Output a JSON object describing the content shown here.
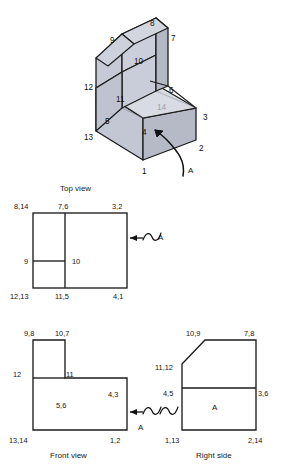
{
  "drawing": {
    "title_visible": false,
    "stroke_color": "#1c1c1c",
    "face_colors": {
      "top_light": "#d7dae2",
      "top_mid": "#cdd1db",
      "front_left": "#c2c6d2",
      "front_right": "#b9bdca",
      "slope": "#cacee0",
      "inner_base": "#d9dce4"
    }
  },
  "isometric": {
    "name": "isometric-pictorial",
    "vertex_labels": [
      {
        "id": "1",
        "text": "1",
        "x": 142,
        "y": 168
      },
      {
        "id": "2",
        "text": "2",
        "x": 199,
        "y": 145
      },
      {
        "id": "3",
        "text": "3",
        "x": 203,
        "y": 114
      },
      {
        "id": "4",
        "text": "4",
        "x": 142,
        "y": 129
      },
      {
        "id": "5",
        "text": "5",
        "x": 105,
        "y": 118
      },
      {
        "id": "6",
        "text": "6",
        "x": 169,
        "y": 87
      },
      {
        "id": "7",
        "text": "7",
        "x": 171,
        "y": 35
      },
      {
        "id": "8",
        "text": "8",
        "x": 150,
        "y": 20
      },
      {
        "id": "9",
        "text": "9",
        "x": 110,
        "y": 37
      },
      {
        "id": "10",
        "text": "10",
        "x": 134,
        "y": 58
      },
      {
        "id": "11",
        "text": "11",
        "x": 116,
        "y": 96
      },
      {
        "id": "12",
        "text": "12",
        "x": 84,
        "y": 84
      },
      {
        "id": "13",
        "text": "13",
        "x": 84,
        "y": 134
      },
      {
        "id": "14",
        "text": "14",
        "x": 157,
        "y": 104,
        "faint": true
      }
    ],
    "section_marker": {
      "label": "A",
      "x": 188,
      "y": 167
    }
  },
  "top_view": {
    "name": "top-view",
    "caption": "Top view",
    "caption_pos": {
      "x": 60,
      "y": 185
    },
    "labels": [
      {
        "text": "8,14",
        "x": 14,
        "y": 203,
        "anchor": "left"
      },
      {
        "text": "7,6",
        "x": 58,
        "y": 203,
        "anchor": "left"
      },
      {
        "text": "3,2",
        "x": 112,
        "y": 203,
        "anchor": "left"
      },
      {
        "text": "9",
        "x": 24,
        "y": 258,
        "anchor": "left"
      },
      {
        "text": "10",
        "x": 72,
        "y": 258,
        "anchor": "left"
      },
      {
        "text": "12,13",
        "x": 10,
        "y": 293,
        "anchor": "left"
      },
      {
        "text": "11,5",
        "x": 55,
        "y": 293,
        "anchor": "left"
      },
      {
        "text": "4,1",
        "x": 113,
        "y": 293,
        "anchor": "left"
      }
    ],
    "section_marker": {
      "label": "A",
      "x": 158,
      "y": 234
    }
  },
  "front_view": {
    "name": "front-view",
    "caption": "Front view",
    "caption_pos": {
      "x": 50,
      "y": 452
    },
    "labels": [
      {
        "text": "9,8",
        "x": 24,
        "y": 330,
        "anchor": "left"
      },
      {
        "text": "10,7",
        "x": 55,
        "y": 330,
        "anchor": "left"
      },
      {
        "text": "12",
        "x": 13,
        "y": 371,
        "anchor": "left"
      },
      {
        "text": "11",
        "x": 66,
        "y": 371,
        "anchor": "left"
      },
      {
        "text": "4,3",
        "x": 108,
        "y": 391,
        "anchor": "left"
      },
      {
        "text": "5,6",
        "x": 56,
        "y": 402,
        "anchor": "left"
      },
      {
        "text": "13,14",
        "x": 9,
        "y": 437,
        "anchor": "left"
      },
      {
        "text": "1,2",
        "x": 110,
        "y": 437,
        "anchor": "left"
      }
    ],
    "section_marker": {
      "label": "A",
      "x": 138,
      "y": 424
    }
  },
  "right_side_view": {
    "name": "right-side-view",
    "caption": "Right side",
    "caption_pos": {
      "x": 196,
      "y": 452
    },
    "face_label": {
      "text": "A",
      "x": 212,
      "y": 404
    },
    "labels": [
      {
        "text": "10,9",
        "x": 186,
        "y": 330,
        "anchor": "left"
      },
      {
        "text": "7,8",
        "x": 244,
        "y": 330,
        "anchor": "left"
      },
      {
        "text": "11,12",
        "x": 155,
        "y": 364,
        "anchor": "left"
      },
      {
        "text": "4,5",
        "x": 163,
        "y": 390,
        "anchor": "left"
      },
      {
        "text": "3,6",
        "x": 258,
        "y": 390,
        "anchor": "left"
      },
      {
        "text": "1,13",
        "x": 165,
        "y": 437,
        "anchor": "left"
      },
      {
        "text": "2,14",
        "x": 248,
        "y": 437,
        "anchor": "left"
      }
    ]
  }
}
